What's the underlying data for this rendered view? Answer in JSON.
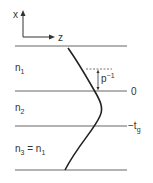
{
  "diagram": {
    "axes": {
      "x_label": "x",
      "z_label": "z"
    },
    "layers": [
      {
        "label": "n",
        "sub": "1"
      },
      {
        "label": "n",
        "sub": "2"
      },
      {
        "label": "n",
        "sub": "3",
        "suffix": " = n",
        "suffix_sub": "1"
      }
    ],
    "boundaries": {
      "zero_label": "0",
      "minus_label": "−t",
      "minus_sub": "g"
    },
    "decay": {
      "label": "p",
      "sup": "−1"
    }
  }
}
